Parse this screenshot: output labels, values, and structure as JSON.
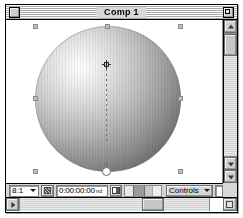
{
  "window": {
    "title": "Comp 1",
    "close_box": "close-box",
    "zoom_box": "zoom-box"
  },
  "canvas": {
    "background_color": "#ffffff",
    "layer": {
      "name": "sphere-layer",
      "shape": "sphere",
      "highlight_color": "#fdfdfd",
      "shadow_color": "#3f3f3f"
    },
    "selection_handles": 8,
    "motion_path": {
      "name": "motion-path",
      "style": "dotted",
      "color": "#6e6e6e"
    },
    "anchor_point": "anchor-point",
    "rotate_handle": "rotate-handle"
  },
  "toolbar": {
    "zoom_ratio": "8:1",
    "resolution_label": "resolution-button",
    "timecode": "0:00:00:00",
    "timecode_suffix": "nd",
    "quality_label": "quality-button",
    "exposure_label": "exposure-slider",
    "controls_label": "Controls"
  },
  "scrollbars": {
    "vertical_up": "scroll-up",
    "vertical_down": "scroll-down",
    "horizontal_left": "scroll-left",
    "horizontal_right": "scroll-right",
    "grow_box": "grow-box"
  }
}
